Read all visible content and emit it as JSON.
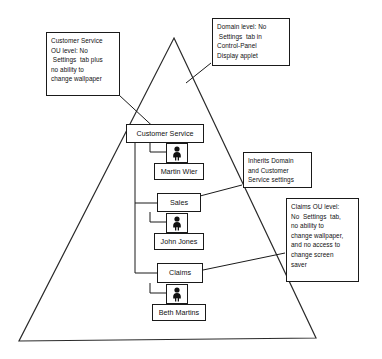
{
  "diagram": {
    "type": "active-directory-group-policy-inheritance",
    "shape": "triangle",
    "notes": [
      {
        "id": "customer-service-ou-note",
        "lines": [
          "Customer Service",
          "OU level: No",
          " Settings  tab plus",
          "no ability to",
          "change wallpaper"
        ]
      },
      {
        "id": "domain-level-note",
        "lines": [
          "Domain level: No",
          " Settings  tab in",
          "Control-Panel",
          "Display applet"
        ]
      },
      {
        "id": "inherits-note",
        "lines": [
          "Inherits Domain",
          "and Customer",
          "Service settings"
        ]
      },
      {
        "id": "claims-ou-note",
        "lines": [
          "Claims OU level:",
          "No  Settings  tab,",
          "no ability to",
          "change wallpaper,",
          "and no access to",
          "change screen",
          "saver"
        ]
      }
    ],
    "nodes": [
      {
        "id": "customer-service",
        "label": "Customer Service"
      },
      {
        "id": "martin-wier",
        "label": "Martin Wier"
      },
      {
        "id": "sales",
        "label": "Sales"
      },
      {
        "id": "john-jones",
        "label": "John Jones"
      },
      {
        "id": "claims",
        "label": "Claims"
      },
      {
        "id": "beth-martins",
        "label": "Beth Martins"
      }
    ],
    "icons": {
      "user": "user-icon"
    },
    "colors": {
      "line": "#1a1a1a",
      "background": "#ffffff",
      "text": "#111111",
      "icon": "#111111"
    }
  }
}
